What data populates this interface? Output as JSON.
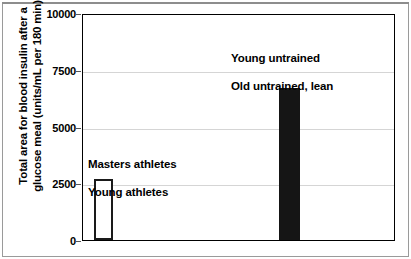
{
  "chart_data": {
    "type": "bar",
    "title": "",
    "xlabel": "",
    "ylabel": "Total area for blood insulin after a\nglucose meal (units/mL per 180 min)",
    "ylabel_line1": "Total area for blood insulin after a",
    "ylabel_line2": "glucose meal (units/mL per 180 min)",
    "ylim": [
      0,
      10000
    ],
    "yticks": [
      0,
      2500,
      5000,
      7500,
      10000
    ],
    "ytick_labels": [
      "0",
      "2500",
      "5000",
      "7500",
      "10000"
    ],
    "grid": true,
    "legend_position": "none",
    "categories": [
      "Masters athletes\nYoung athletes",
      "Young untrained\nOld untrained, lean"
    ],
    "values": [
      2700,
      6750
    ],
    "bars": [
      {
        "label_line1": "Masters athletes",
        "label_line2": "Young athletes",
        "value": 2700,
        "fill": "#ffffff",
        "edge": "#1a1a1a",
        "style": "open"
      },
      {
        "label_line1": "Young untrained",
        "label_line2": "Old untrained, lean",
        "value": 6750,
        "fill": "#151515",
        "edge": "#151515",
        "style": "filled"
      }
    ],
    "annotations": [
      {
        "text": "Masters athletes\nYoung athletes"
      },
      {
        "text": "Young untrained\nOld untrained, lean"
      }
    ],
    "colors": {
      "grid": "#d5d5d5",
      "axis": "#000000",
      "frame": "#9a9a9a",
      "background": "#ffffff"
    }
  }
}
